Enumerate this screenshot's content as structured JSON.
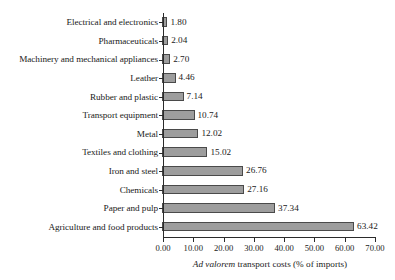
{
  "chart_data": {
    "type": "bar",
    "orientation": "horizontal",
    "title": "",
    "xlabel_parts": {
      "italic": "Ad valorem",
      "rest": " transport costs (% of imports)"
    },
    "xlabel": "Ad valorem transport costs (% of imports)",
    "ylabel": "",
    "xlim": [
      0,
      70
    ],
    "xticks": [
      "0.00",
      "10.00",
      "20.00",
      "30.00",
      "40.00",
      "50.00",
      "60.00",
      "70.00"
    ],
    "xtick_values": [
      0,
      10,
      20,
      30,
      40,
      50,
      60,
      70
    ],
    "grid": false,
    "legend": false,
    "categories": [
      "Electrical and electronics",
      "Pharmaceuticals",
      "Machinery and mechanical appliances",
      "Leather",
      "Rubber and plastic",
      "Transport equipment",
      "Metal",
      "Textiles and clothing",
      "Iron and steel",
      "Chemicals",
      "Paper and pulp",
      "Agriculture and food products"
    ],
    "values": [
      1.8,
      2.04,
      2.7,
      4.46,
      7.14,
      10.74,
      12.02,
      15.02,
      26.76,
      27.16,
      37.34,
      63.42
    ],
    "value_labels": [
      "1.80",
      "2.04",
      "2.70",
      "4.46",
      "7.14",
      "10.74",
      "12.02",
      "15.02",
      "26.76",
      "27.16",
      "37.34",
      "63.42"
    ],
    "colors": {
      "bar_fill": "#9d9d9d",
      "bar_border": "#4a4a4a",
      "axis": "#2b2b2b",
      "text": "#1a1a1a",
      "background": "#ffffff"
    }
  }
}
